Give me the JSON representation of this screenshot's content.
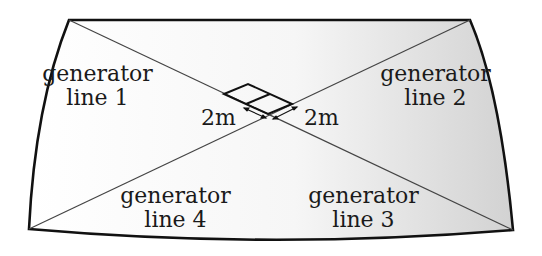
{
  "diagram": {
    "labels": {
      "gen1": {
        "line1": "generator",
        "line2": "line 1"
      },
      "gen2": {
        "line1": "generator",
        "line2": "line 2"
      },
      "gen3": {
        "line1": "generator",
        "line2": "line 3"
      },
      "gen4": {
        "line1": "generator",
        "line2": "line 4"
      }
    },
    "dimensions": {
      "left": "2m",
      "right": "2m"
    },
    "colors": {
      "outline": "#111111",
      "lines": "#444444",
      "fill_light": "#ffffff",
      "fill_shade": "#d4d4d4"
    }
  }
}
